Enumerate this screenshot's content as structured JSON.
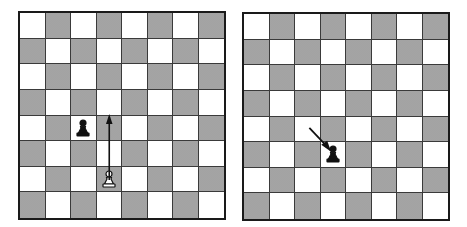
{
  "colors": {
    "light_square": "#ffffff",
    "dark_square": "#c8c8c8",
    "border": "#1a1a1a",
    "black_piece": "#111111",
    "white_piece": "#ffffff"
  },
  "boards": [
    {
      "id": "left",
      "pieces": [
        {
          "type": "pawn",
          "color": "black",
          "col": 2,
          "row": 4,
          "icon": "black-pawn-icon"
        },
        {
          "type": "pawn",
          "color": "white",
          "col": 3,
          "row": 6,
          "icon": "white-pawn-icon"
        }
      ],
      "arrows": [
        {
          "from": {
            "col": 3,
            "row": 6
          },
          "to": {
            "col": 3,
            "row": 4
          },
          "direction": "up",
          "icon": "arrow-up-icon"
        }
      ]
    },
    {
      "id": "right",
      "pieces": [
        {
          "type": "pawn",
          "color": "black",
          "col": 3,
          "row": 5,
          "icon": "black-pawn-icon"
        }
      ],
      "arrows": [
        {
          "from": {
            "col": 2,
            "row": 4
          },
          "to": {
            "col": 3,
            "row": 5
          },
          "direction": "down-right",
          "icon": "arrow-diagonal-icon"
        }
      ]
    }
  ]
}
